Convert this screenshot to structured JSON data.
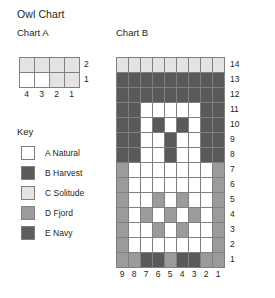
{
  "title": "Owl Chart",
  "chart_a": {
    "title": "Chart A",
    "columns": 4,
    "rows": 2,
    "row_labels": [
      "2",
      "1"
    ],
    "col_labels": [
      "4",
      "3",
      "2",
      "1"
    ],
    "cells": [
      [
        "C",
        "C",
        "C",
        "C"
      ],
      [
        "A",
        "A",
        "C",
        "C"
      ]
    ]
  },
  "chart_b": {
    "title": "Chart B",
    "columns": 9,
    "rows": 14,
    "row_labels": [
      "14",
      "13",
      "12",
      "11",
      "10",
      "9",
      "8",
      "7",
      "6",
      "5",
      "4",
      "3",
      "2",
      "1"
    ],
    "col_labels": [
      "9",
      "8",
      "7",
      "6",
      "5",
      "4",
      "3",
      "2",
      "1"
    ],
    "cells": [
      [
        "C",
        "C",
        "C",
        "C",
        "C",
        "C",
        "C",
        "C",
        "C"
      ],
      [
        "B",
        "B",
        "B",
        "B",
        "B",
        "B",
        "B",
        "B",
        "B"
      ],
      [
        "B",
        "B",
        "B",
        "B",
        "B",
        "B",
        "B",
        "B",
        "B"
      ],
      [
        "B",
        "B",
        "A",
        "A",
        "A",
        "A",
        "A",
        "B",
        "B"
      ],
      [
        "B",
        "B",
        "A",
        "B",
        "A",
        "B",
        "A",
        "B",
        "B"
      ],
      [
        "B",
        "B",
        "A",
        "A",
        "B",
        "A",
        "A",
        "B",
        "B"
      ],
      [
        "B",
        "B",
        "A",
        "A",
        "B",
        "A",
        "A",
        "B",
        "B"
      ],
      [
        "D",
        "A",
        "A",
        "A",
        "A",
        "A",
        "A",
        "A",
        "D"
      ],
      [
        "D",
        "A",
        "A",
        "A",
        "A",
        "A",
        "A",
        "A",
        "D"
      ],
      [
        "D",
        "A",
        "A",
        "D",
        "A",
        "D",
        "A",
        "A",
        "D"
      ],
      [
        "D",
        "A",
        "D",
        "A",
        "D",
        "A",
        "D",
        "A",
        "D"
      ],
      [
        "D",
        "A",
        "A",
        "D",
        "A",
        "D",
        "A",
        "A",
        "D"
      ],
      [
        "D",
        "A",
        "A",
        "A",
        "A",
        "A",
        "A",
        "A",
        "D"
      ],
      [
        "D",
        "D",
        "B",
        "B",
        "D",
        "B",
        "B",
        "D",
        "D"
      ]
    ]
  },
  "key": {
    "title": "Key",
    "entries": [
      {
        "code": "A",
        "label": "A Natural",
        "color": "#ffffff"
      },
      {
        "code": "B",
        "label": "B Harvest",
        "color": "#5a5a5a"
      },
      {
        "code": "C",
        "label": "C Solitude",
        "color": "#e3e3e3"
      },
      {
        "code": "D",
        "label": "D Fjord",
        "color": "#9b9b9b"
      },
      {
        "code": "E",
        "label": "E Navy",
        "color": "#5e5e5e"
      }
    ]
  },
  "colors": {
    "A": "#ffffff",
    "B": "#5a5a5a",
    "C": "#e3e3e3",
    "D": "#9b9b9b",
    "E": "#5e5e5e",
    "gridline": "#808080",
    "text": "#231f20"
  }
}
